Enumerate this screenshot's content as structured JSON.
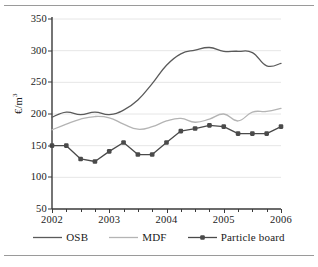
{
  "chart_data": {
    "type": "line",
    "title": "",
    "xlabel": "",
    "ylabel": "€/m³",
    "ylim": [
      50,
      350
    ],
    "xlim": [
      2002,
      2006
    ],
    "ytick_values": [
      50,
      100,
      150,
      200,
      250,
      300,
      350
    ],
    "ytick_labels": [
      "50",
      "100",
      "150",
      "200",
      "250",
      "300",
      "350"
    ],
    "xtick_values": [
      2002,
      2003,
      2004,
      2005,
      2006
    ],
    "xtick_labels": [
      "2002",
      "2003",
      "2004",
      "2005",
      "2006"
    ],
    "x_minor_interval": 0.25,
    "grid": "horizontal",
    "legend_position": "bottom",
    "x": [
      2002.0,
      2002.25,
      2002.5,
      2002.75,
      2003.0,
      2003.25,
      2003.5,
      2003.75,
      2004.0,
      2004.25,
      2004.5,
      2004.75,
      2005.0,
      2005.25,
      2005.5,
      2005.75,
      2006.0
    ],
    "series": [
      {
        "name": "OSB",
        "color": "#5a5a5a",
        "marker": "none",
        "values": [
          195,
          203,
          199,
          203,
          199,
          206,
          222,
          248,
          277,
          295,
          301,
          305,
          299,
          299,
          297,
          276,
          280
        ]
      },
      {
        "name": "MDF",
        "color": "#b4b4b4",
        "marker": "none",
        "values": [
          175,
          184,
          192,
          196,
          194,
          184,
          176,
          180,
          189,
          193,
          187,
          192,
          200,
          189,
          203,
          204,
          209
        ]
      },
      {
        "name": "Particle board",
        "color": "#4a4a4a",
        "marker": "square",
        "values": [
          150,
          150,
          129,
          125,
          141,
          155,
          136,
          136,
          155,
          173,
          177,
          182,
          180,
          169,
          169,
          169,
          180
        ]
      }
    ]
  },
  "legend": {
    "items": [
      {
        "label": "OSB"
      },
      {
        "label": "MDF"
      },
      {
        "label": "Particle board"
      }
    ]
  }
}
